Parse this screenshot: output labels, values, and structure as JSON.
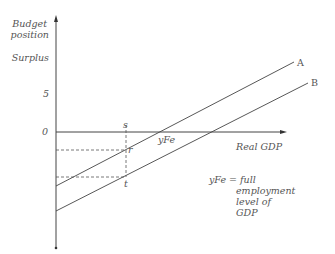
{
  "diagram": {
    "y_axis_label_line1": "Budget",
    "y_axis_label_line2": "position",
    "surplus_label": "Surplus",
    "tick_5": "5",
    "tick_0": "0",
    "x_axis_label": "Real GDP",
    "line_a_label": "A",
    "line_b_label": "B",
    "point_s": "s",
    "point_r": "r",
    "point_t": "t",
    "yfe_label": "yFe",
    "note_line1": "yFe = full",
    "note_line2": "employment",
    "note_line3": "level of",
    "note_line4": "GDP",
    "colors": {
      "line": "#444444",
      "text": "#555555"
    }
  }
}
